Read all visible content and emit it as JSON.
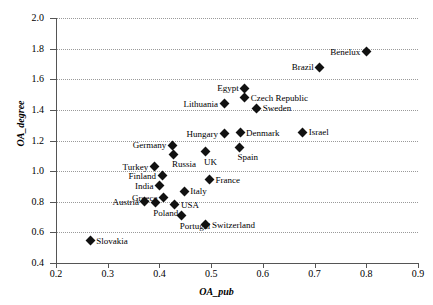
{
  "chart_data": {
    "type": "scatter",
    "title": "",
    "xlabel": "OA_pub",
    "ylabel": "OA_degree",
    "xlim": [
      0.2,
      0.9
    ],
    "ylim": [
      0.4,
      2.0
    ],
    "xticks": [
      "0.2",
      "0.3",
      "0.4",
      "0.5",
      "0.6",
      "0.7",
      "0.8",
      "0.9"
    ],
    "yticks": [
      "0.4",
      "0.6",
      "0.8",
      "1.0",
      "1.2",
      "1.4",
      "1.6",
      "1.8",
      "2.0"
    ],
    "xtick_values": [
      0.2,
      0.3,
      0.4,
      0.5,
      0.6,
      0.7,
      0.8,
      0.9
    ],
    "ytick_values": [
      0.4,
      0.6,
      0.8,
      1.0,
      1.2,
      1.4,
      1.6,
      1.8,
      2.0
    ],
    "grid": "horizontal-dotted",
    "legend": "none",
    "marker": "filled-diamond",
    "marker_color": "#111111",
    "points": [
      {
        "label": "Benelux",
        "x": 0.8,
        "y": 1.78,
        "label_side": "left"
      },
      {
        "label": "Brazil",
        "x": 0.71,
        "y": 1.68,
        "label_side": "left"
      },
      {
        "label": "Egypt",
        "x": 0.565,
        "y": 1.54,
        "label_side": "left"
      },
      {
        "label": "Czech Republic",
        "x": 0.565,
        "y": 1.48,
        "label_side": "right"
      },
      {
        "label": "Lithuania",
        "x": 0.525,
        "y": 1.44,
        "label_side": "left"
      },
      {
        "label": "Sweden",
        "x": 0.588,
        "y": 1.41,
        "label_side": "right"
      },
      {
        "label": "Hungary",
        "x": 0.525,
        "y": 1.245,
        "label_side": "left"
      },
      {
        "label": "Denmark",
        "x": 0.556,
        "y": 1.25,
        "label_side": "right"
      },
      {
        "label": "Israel",
        "x": 0.677,
        "y": 1.255,
        "label_side": "right"
      },
      {
        "label": "Germany",
        "x": 0.425,
        "y": 1.17,
        "label_side": "left"
      },
      {
        "label": "Spain",
        "x": 0.555,
        "y": 1.155,
        "label_side": "below"
      },
      {
        "label": "UK",
        "x": 0.49,
        "y": 1.125,
        "label_side": "below"
      },
      {
        "label": "Russia",
        "x": 0.428,
        "y": 1.11,
        "label_side": "below"
      },
      {
        "label": "Turkey",
        "x": 0.39,
        "y": 1.03,
        "label_side": "left"
      },
      {
        "label": "Finland",
        "x": 0.405,
        "y": 0.97,
        "label_side": "left"
      },
      {
        "label": "France",
        "x": 0.497,
        "y": 0.945,
        "label_side": "right"
      },
      {
        "label": "India",
        "x": 0.4,
        "y": 0.905,
        "label_side": "left"
      },
      {
        "label": "Italy",
        "x": 0.448,
        "y": 0.87,
        "label_side": "right"
      },
      {
        "label": "Greece",
        "x": 0.408,
        "y": 0.825,
        "label_side": "left"
      },
      {
        "label": "Austria",
        "x": 0.372,
        "y": 0.8,
        "label_side": "left"
      },
      {
        "label": "USA",
        "x": 0.43,
        "y": 0.78,
        "label_side": "right"
      },
      {
        "label": "Poland",
        "x": 0.392,
        "y": 0.795,
        "label_side": "below"
      },
      {
        "label": "Portugal",
        "x": 0.443,
        "y": 0.71,
        "label_side": "below"
      },
      {
        "label": "Switzerland",
        "x": 0.49,
        "y": 0.65,
        "label_side": "right"
      },
      {
        "label": "Slovakia",
        "x": 0.266,
        "y": 0.545,
        "label_side": "right"
      }
    ]
  }
}
